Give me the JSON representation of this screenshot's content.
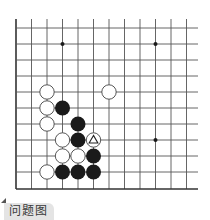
{
  "diagram": {
    "type": "go-problem",
    "grid": {
      "columns_x": [
        16,
        31.5,
        47,
        62.5,
        78,
        93.5,
        109,
        124.5,
        140,
        155.5,
        171,
        186.5
      ],
      "rows_y": [
        28,
        44,
        60,
        76,
        92,
        108,
        124,
        140,
        156,
        172,
        189
      ],
      "right_extent": 198,
      "top_extent": 19,
      "left_edge_is_border": true,
      "bottom_edge_is_border": true,
      "line_color": "#555555",
      "border_color": "#333333"
    },
    "star_points": [
      {
        "col": 3,
        "row": 1
      },
      {
        "col": 9,
        "row": 1
      },
      {
        "col": 9,
        "row": 7
      }
    ],
    "stones": [
      {
        "color": "white",
        "col": 2,
        "row": 4
      },
      {
        "color": "white",
        "col": 6,
        "row": 4
      },
      {
        "color": "white",
        "col": 2,
        "row": 5
      },
      {
        "color": "black",
        "col": 3,
        "row": 5
      },
      {
        "color": "white",
        "col": 2,
        "row": 6
      },
      {
        "color": "black",
        "col": 4,
        "row": 6
      },
      {
        "color": "white",
        "col": 3,
        "row": 7
      },
      {
        "color": "black",
        "col": 4,
        "row": 7
      },
      {
        "color": "white",
        "col": 5,
        "row": 7,
        "marker": "triangle"
      },
      {
        "color": "white",
        "col": 3,
        "row": 8
      },
      {
        "color": "white",
        "col": 4,
        "row": 8
      },
      {
        "color": "black",
        "col": 5,
        "row": 8
      },
      {
        "color": "white",
        "col": 2,
        "row": 9
      },
      {
        "color": "black",
        "col": 3,
        "row": 9
      },
      {
        "color": "black",
        "col": 4,
        "row": 9
      },
      {
        "color": "black",
        "col": 5,
        "row": 9
      }
    ],
    "stone_radius": 7.5,
    "colors": {
      "black_stone": "#1a1a1a",
      "white_stone_fill": "#ffffff",
      "white_stone_stroke": "#444444"
    }
  },
  "caption": {
    "label": "问题图"
  }
}
